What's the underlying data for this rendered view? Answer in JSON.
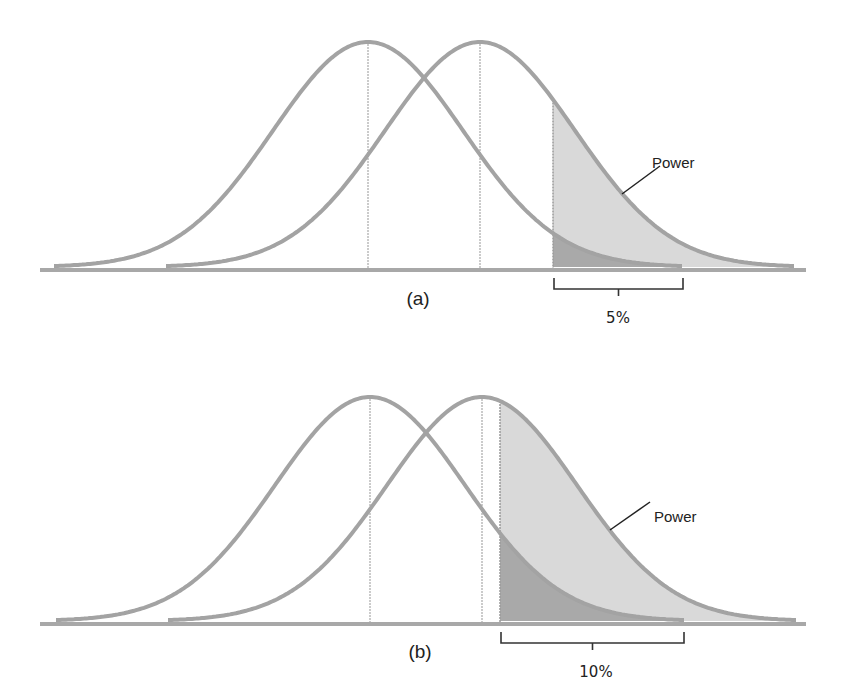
{
  "figure": {
    "panels": [
      {
        "id": "a",
        "label": "(a)",
        "alpha_label": "5%",
        "power_label": "Power",
        "baseline_y": 270,
        "peak_y": 42,
        "null_mean_x": 368,
        "alt_mean_x": 480,
        "critical_x": 553,
        "bracket": {
          "x1": 554,
          "x2": 683
        },
        "label_pos": {
          "x": 418,
          "y": 305
        },
        "pct_pos": {
          "x": 618,
          "y": 323
        },
        "power_text_pos": {
          "x": 652,
          "y": 168
        },
        "power_line": {
          "x1": 622,
          "y1": 194,
          "x2": 660,
          "y2": 166
        }
      },
      {
        "id": "b",
        "label": "(b)",
        "alpha_label": "10%",
        "power_label": "Power",
        "baseline_y": 624,
        "peak_y": 397,
        "null_mean_x": 370,
        "alt_mean_x": 482,
        "critical_x": 500,
        "bracket": {
          "x1": 501,
          "x2": 684
        },
        "label_pos": {
          "x": 420,
          "y": 658
        },
        "pct_pos": {
          "x": 596,
          "y": 677
        },
        "power_text_pos": {
          "x": 654,
          "y": 522
        },
        "power_line": {
          "x1": 610,
          "y1": 530,
          "x2": 650,
          "y2": 502
        }
      }
    ],
    "colors": {
      "curve": "#a3a3a3",
      "axis": "#a8a8a8",
      "power_fill": "#d9d9d9",
      "alpha_fill": "#a9a9a9",
      "mean_line": "#b0b0b0",
      "bracket": "#333333",
      "text": "#222222"
    },
    "sigma_px": 95,
    "curve_span_px": 314
  }
}
